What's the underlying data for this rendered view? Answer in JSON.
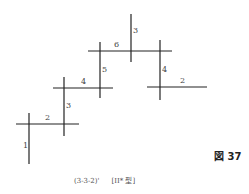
{
  "figure": {
    "label": "図 37",
    "caption_code": "(3-3-2)'",
    "caption_type": "[II* 型]"
  },
  "colors": {
    "line": "#222222",
    "label": "#444444",
    "background": "#ffffff"
  },
  "segments": [
    {
      "id": "v1",
      "orientation": "vertical",
      "x1": 29,
      "y1": 113,
      "x2": 29,
      "y2": 164,
      "label": "1",
      "label_x": 23,
      "label_y": 142
    },
    {
      "id": "h2",
      "orientation": "horizontal",
      "x1": 16,
      "y1": 124,
      "x2": 79,
      "y2": 124,
      "label": "2",
      "label_x": 45,
      "label_y": 114
    },
    {
      "id": "v3",
      "orientation": "vertical",
      "x1": 64,
      "y1": 77,
      "x2": 64,
      "y2": 136,
      "label": "3",
      "label_x": 66,
      "label_y": 102
    },
    {
      "id": "h4",
      "orientation": "horizontal",
      "x1": 53,
      "y1": 88,
      "x2": 113,
      "y2": 88,
      "label": "4",
      "label_x": 81,
      "label_y": 78
    },
    {
      "id": "v5",
      "orientation": "vertical",
      "x1": 100,
      "y1": 42,
      "x2": 100,
      "y2": 98,
      "label": "5",
      "label_x": 102,
      "label_y": 66
    },
    {
      "id": "h6",
      "orientation": "horizontal",
      "x1": 88,
      "y1": 51,
      "x2": 172,
      "y2": 51,
      "label": "6",
      "label_x": 114,
      "label_y": 41
    },
    {
      "id": "v3b",
      "orientation": "vertical",
      "x1": 131,
      "y1": 14,
      "x2": 131,
      "y2": 62,
      "label": "3",
      "label_x": 133,
      "label_y": 27
    },
    {
      "id": "v4b",
      "orientation": "vertical",
      "x1": 160,
      "y1": 40,
      "x2": 160,
      "y2": 100,
      "label": "4",
      "label_x": 162,
      "label_y": 66
    },
    {
      "id": "h2b",
      "orientation": "horizontal",
      "x1": 147,
      "y1": 87,
      "x2": 207,
      "y2": 87,
      "label": "2",
      "label_x": 180,
      "label_y": 77
    }
  ]
}
